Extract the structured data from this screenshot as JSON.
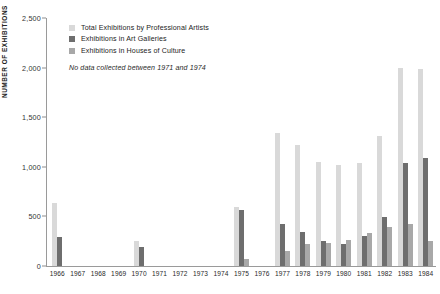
{
  "chart_data": {
    "type": "bar",
    "title": "",
    "xlabel": "",
    "ylabel": "NUMBER OF EXHIBITIONS",
    "ylim": [
      0,
      2500
    ],
    "ytick_labels": [
      "0",
      "500",
      "1,000",
      "1,500",
      "2,000",
      "2,500"
    ],
    "ytick_values": [
      0,
      500,
      1000,
      1500,
      2000,
      2500
    ],
    "grid": false,
    "legend_position": "top-left",
    "note": "No data collected between 1971 and 1974",
    "categories": [
      "1966",
      "1967",
      "1968",
      "1969",
      "1970",
      "1971",
      "1972",
      "1973",
      "1974",
      "1975",
      "1976",
      "1977",
      "1978",
      "1979",
      "1980",
      "1981",
      "1982",
      "1983",
      "1984"
    ],
    "series": [
      {
        "name": "Total Exhibitions by Professional Artists",
        "color": "#d9d9d9",
        "values": [
          640,
          0,
          0,
          0,
          255,
          0,
          0,
          0,
          0,
          590,
          0,
          1340,
          1220,
          1050,
          1020,
          1040,
          1310,
          1995,
          1990
        ]
      },
      {
        "name": "Exhibitions in Art Galleries",
        "color": "#6e6e6e",
        "values": [
          290,
          0,
          0,
          0,
          195,
          0,
          0,
          0,
          0,
          565,
          0,
          425,
          345,
          250,
          220,
          300,
          490,
          1040,
          1090
        ]
      },
      {
        "name": "Exhibitions in Houses of Culture",
        "color": "#a8a8a8",
        "values": [
          0,
          0,
          0,
          0,
          0,
          0,
          0,
          0,
          0,
          75,
          0,
          155,
          225,
          235,
          265,
          330,
          395,
          420,
          255
        ]
      }
    ]
  },
  "legend": {
    "items": [
      {
        "label": "Total Exhibitions by Professional Artists"
      },
      {
        "label": "Exhibitions in Art Galleries"
      },
      {
        "label": "Exhibitions in Houses of Culture"
      }
    ],
    "note": "No data collected between 1971 and 1974"
  }
}
